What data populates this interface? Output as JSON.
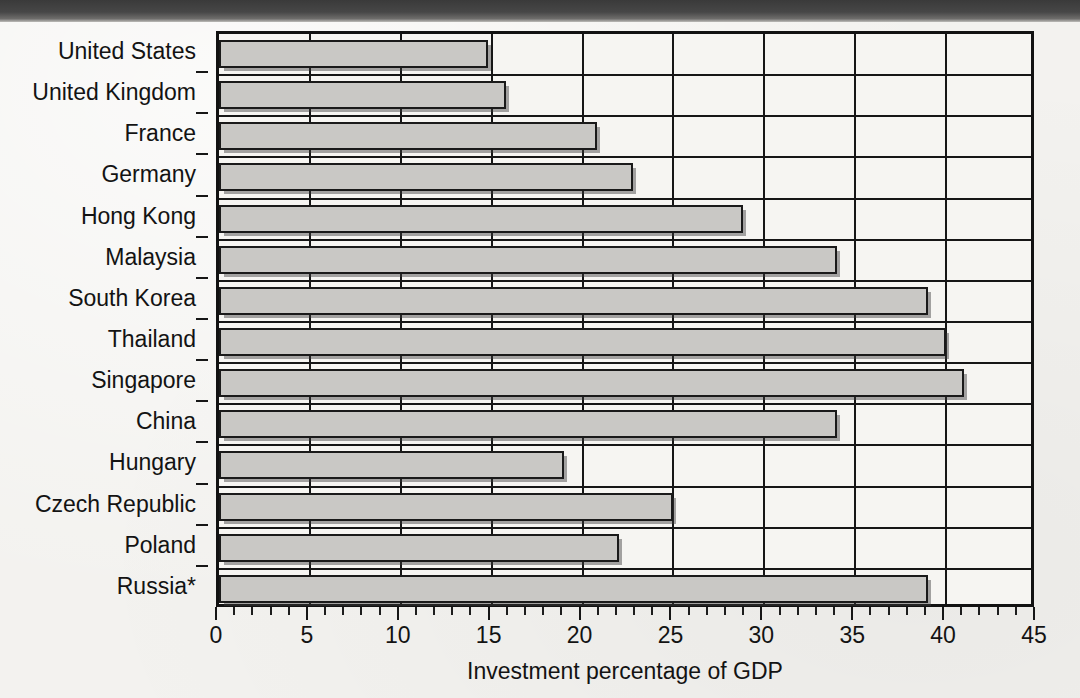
{
  "chart_data": {
    "type": "bar",
    "orientation": "horizontal",
    "title": "",
    "xlabel": "Investment percentage of GDP",
    "ylabel": "",
    "xlim": [
      0,
      45
    ],
    "xticks": [
      0,
      5,
      10,
      15,
      20,
      25,
      30,
      35,
      40,
      45
    ],
    "xtick_labels": [
      "0",
      "5",
      "10",
      "15",
      "20",
      "25",
      "30",
      "35",
      "40",
      "45"
    ],
    "minor_tick_interval": 1,
    "grid": "vertical-major",
    "legend": "none",
    "footnote_marker": "*",
    "categories": [
      "United States",
      "United Kingdom",
      "France",
      "Germany",
      "Hong Kong",
      "Malaysia",
      "South Korea",
      "Thailand",
      "Singapore",
      "China",
      "Hungary",
      "Czech Republic",
      "Poland",
      "Russia*"
    ],
    "values": [
      14.8,
      15.8,
      20.8,
      22.8,
      28.8,
      34.0,
      39.0,
      40.0,
      41.0,
      34.0,
      19.0,
      25.0,
      22.0,
      39.0
    ]
  },
  "colors": {
    "bar_fill": "#c9c8c5",
    "bar_edge": "#1a1a1a",
    "axis": "#161616",
    "text": "#131313",
    "paper": "#f3f2ef",
    "scan_edge": "#3a3a3a"
  }
}
